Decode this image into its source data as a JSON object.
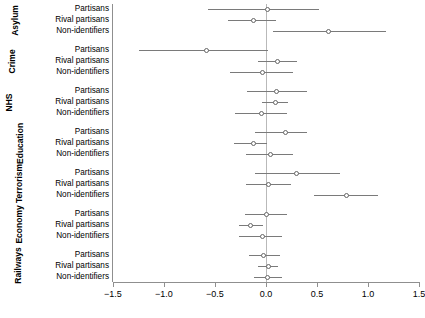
{
  "chart_data": {
    "type": "scatter",
    "plot_style": "forest-plot-coefficient-plot",
    "title": "",
    "subtitle": "",
    "xlabel": "",
    "ylabel": "",
    "xlim": [
      -1.5,
      1.5
    ],
    "xticks": [
      -1.5,
      -1.0,
      -0.5,
      0.0,
      0.5,
      1.0,
      1.5
    ],
    "xtick_labels": [
      "-1.5",
      "-1.0",
      "-0.5",
      "0.0",
      "0.5",
      "1.0",
      "1.5"
    ],
    "grid": false,
    "legend": null,
    "reference_line_x": 0.0,
    "row_categories": [
      "Partisans",
      "Rival partisans",
      "Non-identifiers"
    ],
    "panel_order": [
      "Asylum",
      "Crime",
      "NHS",
      "Education",
      "Terrorism",
      "Economy",
      "Railways"
    ],
    "marker": "open-circle",
    "panels": [
      {
        "name": "Asylum",
        "rows": [
          {
            "label": "Partisans",
            "estimate": 0.01,
            "ci_low": -0.57,
            "ci_high": 0.52
          },
          {
            "label": "Rival partisans",
            "estimate": -0.12,
            "ci_low": -0.37,
            "ci_high": 0.1
          },
          {
            "label": "Non-identifiers",
            "estimate": 0.61,
            "ci_low": 0.07,
            "ci_high": 1.18
          }
        ]
      },
      {
        "name": "Crime",
        "rows": [
          {
            "label": "Partisans",
            "estimate": -0.58,
            "ci_low": -1.25,
            "ci_high": 0.02
          },
          {
            "label": "Rival partisans",
            "estimate": 0.11,
            "ci_low": -0.08,
            "ci_high": 0.3
          },
          {
            "label": "Non-identifiers",
            "estimate": -0.03,
            "ci_low": -0.35,
            "ci_high": 0.26
          }
        ]
      },
      {
        "name": "NHS",
        "rows": [
          {
            "label": "Partisans",
            "estimate": 0.1,
            "ci_low": -0.19,
            "ci_high": 0.4
          },
          {
            "label": "Rival partisans",
            "estimate": 0.09,
            "ci_low": -0.04,
            "ci_high": 0.22
          },
          {
            "label": "Non-identifiers",
            "estimate": -0.04,
            "ci_low": -0.3,
            "ci_high": 0.21
          }
        ]
      },
      {
        "name": "Education",
        "rows": [
          {
            "label": "Partisans",
            "estimate": 0.19,
            "ci_low": -0.11,
            "ci_high": 0.4
          },
          {
            "label": "Rival partisans",
            "estimate": -0.12,
            "ci_low": -0.31,
            "ci_high": 0.01
          },
          {
            "label": "Non-identifiers",
            "estimate": 0.04,
            "ci_low": -0.2,
            "ci_high": 0.26
          }
        ]
      },
      {
        "name": "Terrorism",
        "rows": [
          {
            "label": "Partisans",
            "estimate": 0.3,
            "ci_low": -0.11,
            "ci_high": 0.73
          },
          {
            "label": "Rival partisans",
            "estimate": 0.02,
            "ci_low": -0.2,
            "ci_high": 0.25
          },
          {
            "label": "Non-identifiers",
            "estimate": 0.79,
            "ci_low": 0.47,
            "ci_high": 1.1
          }
        ]
      },
      {
        "name": "Economy",
        "rows": [
          {
            "label": "Partisans",
            "estimate": 0.0,
            "ci_low": -0.21,
            "ci_high": 0.21
          },
          {
            "label": "Rival partisans",
            "estimate": -0.15,
            "ci_low": -0.26,
            "ci_high": -0.03
          },
          {
            "label": "Non-identifiers",
            "estimate": -0.03,
            "ci_low": -0.26,
            "ci_high": 0.16
          }
        ]
      },
      {
        "name": "Railways",
        "rows": [
          {
            "label": "Partisans",
            "estimate": -0.02,
            "ci_low": -0.17,
            "ci_high": 0.14
          },
          {
            "label": "Rival partisans",
            "estimate": 0.02,
            "ci_low": -0.08,
            "ci_high": 0.12
          },
          {
            "label": "Non-identifiers",
            "estimate": 0.01,
            "ci_low": -0.12,
            "ci_high": 0.16
          }
        ]
      }
    ]
  },
  "colors": {
    "axis": "#8f8f8f",
    "interval": "#7a7a7a",
    "marker_edge": "#666666",
    "marker_fill": "#ffffff",
    "reference_line": "#b9b9b9",
    "background": "#ffffff",
    "text": "#000000"
  }
}
